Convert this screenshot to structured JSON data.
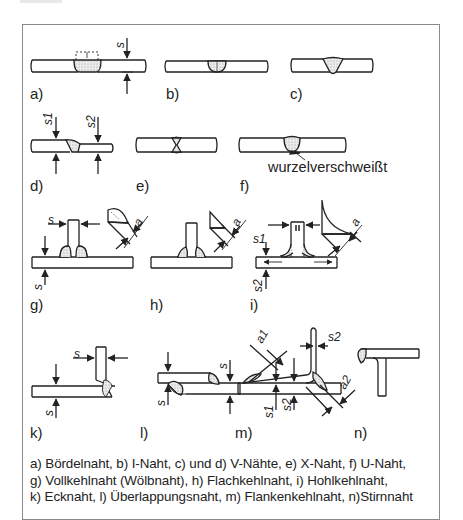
{
  "figure": {
    "panels": [
      {
        "id": "a",
        "label": "a)",
        "dims": [
          "s"
        ]
      },
      {
        "id": "b",
        "label": "b)",
        "dims": []
      },
      {
        "id": "c",
        "label": "c)",
        "dims": []
      },
      {
        "id": "d",
        "label": "d)",
        "dims": [
          "s1",
          "s2"
        ]
      },
      {
        "id": "e",
        "label": "e)",
        "dims": []
      },
      {
        "id": "f",
        "label": "f)",
        "dims": [],
        "annotation": "wurzelverschweißt"
      },
      {
        "id": "g",
        "label": "g)",
        "dims": [
          "s",
          "s",
          "a"
        ]
      },
      {
        "id": "h",
        "label": "h)",
        "dims": [
          "a"
        ]
      },
      {
        "id": "i",
        "label": "i)",
        "dims": [
          "s1",
          "s2",
          "a"
        ]
      },
      {
        "id": "k",
        "label": "k)",
        "dims": [
          "s",
          "s"
        ]
      },
      {
        "id": "l",
        "label": "l)",
        "dims": [
          "s",
          "s"
        ]
      },
      {
        "id": "m",
        "label": "m)",
        "dims": [
          "a1",
          "a2",
          "s1",
          "s2",
          "s2"
        ]
      },
      {
        "id": "n",
        "label": "n)",
        "dims": []
      }
    ],
    "caption": [
      "a) Bördelnaht, b) I-Naht, c) und d) V-Nähte, e) X-Naht, f) U-Naht,",
      "g) Vollkehlnaht (Wölbnaht), h) Flachkehlnaht, i) Hohlkehlnaht,",
      "k) Ecknaht, l) Überlappungsnaht, m) Flankenkehlnaht, n)Stirnnaht"
    ],
    "symbols": {
      "s": "s",
      "s1": "s1",
      "s2": "s2",
      "a": "a",
      "a1": "a1",
      "a2": "a2"
    }
  }
}
